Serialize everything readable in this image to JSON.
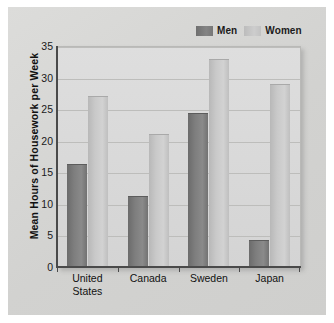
{
  "chart_data": {
    "type": "bar",
    "title": "",
    "xlabel": "",
    "ylabel": "Mean Hours of Housework per Week",
    "categories": [
      "United\nStates",
      "Canada",
      "Sweden",
      "Japan"
    ],
    "series": [
      {
        "name": "Men",
        "values": [
          16.3,
          11.3,
          24.4,
          4.3
        ],
        "color": "#7e7e7e"
      },
      {
        "name": "Women",
        "values": [
          27.1,
          21.1,
          33.0,
          29.0
        ],
        "color": "#c9c9c9"
      }
    ],
    "ylim": [
      0,
      35
    ],
    "yticks": [
      0,
      5,
      10,
      15,
      20,
      25,
      30,
      35
    ],
    "ytick_labels": [
      "0",
      "5",
      "10",
      "15",
      "20",
      "25",
      "30",
      "35"
    ],
    "grid": true,
    "legend_position": "top-right"
  },
  "legend": {
    "men_label": "Men",
    "women_label": "Women"
  },
  "axis": {
    "y_title": "Mean Hours of Housework per Week"
  },
  "colors": {
    "men_bar": "#7e7e7e",
    "women_bar": "#c9c9c9",
    "plot_background": "#d9d9d9",
    "card_background": "#d7d7d5",
    "gridline": "#bdbdbb",
    "axis_line": "#4a4a4a"
  }
}
